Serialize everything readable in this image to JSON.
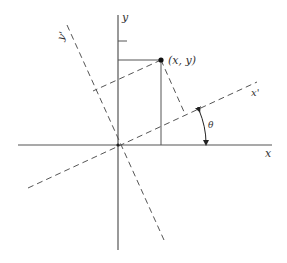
{
  "diagram": {
    "type": "coordinate-rotation",
    "colors": {
      "axis": "#555555",
      "dashed": "#555555",
      "point": "#111111",
      "text": "#333333"
    },
    "labels": {
      "x_axis": "x",
      "y_axis": "y",
      "x_prime_axis": "x'",
      "y_prime_axis": "y'",
      "point": "(x, y)",
      "angle": "θ"
    }
  }
}
